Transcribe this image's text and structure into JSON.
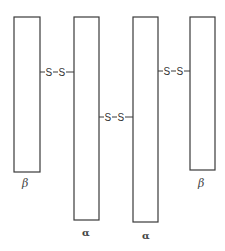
{
  "diagram": {
    "type": "protein-subunit-structure",
    "chains": [
      {
        "id": "beta1",
        "label": "β",
        "x": 14,
        "y": 17,
        "w": 26,
        "h": 155,
        "label_x": 27,
        "label_y": 187
      },
      {
        "id": "alpha1",
        "label": "α",
        "x": 74,
        "y": 17,
        "w": 25,
        "h": 203,
        "label_x": 86,
        "label_y": 236
      },
      {
        "id": "alpha2",
        "label": "α",
        "x": 133,
        "y": 17,
        "w": 25,
        "h": 205,
        "label_x": 146,
        "label_y": 239
      },
      {
        "id": "beta2",
        "label": "β",
        "x": 190,
        "y": 17,
        "w": 25,
        "h": 153,
        "label_x": 203,
        "label_y": 187
      }
    ],
    "bonds": [
      {
        "id": "bond-beta1-alpha1",
        "from": "beta1",
        "to": "alpha1",
        "y": 72,
        "x1": 40,
        "x2": 74,
        "text": "S–S"
      },
      {
        "id": "bond-alpha1-alpha2",
        "from": "alpha1",
        "to": "alpha2",
        "y": 117,
        "x1": 99,
        "x2": 133,
        "text": "S–S"
      },
      {
        "id": "bond-alpha2-beta2",
        "from": "alpha2",
        "to": "beta2",
        "y": 71,
        "x1": 158,
        "x2": 190,
        "text": "S–S"
      }
    ],
    "bond_atom": "S",
    "colors": {
      "stroke": "#3a3a3a",
      "text": "#333333",
      "background": "#ffffff"
    }
  }
}
